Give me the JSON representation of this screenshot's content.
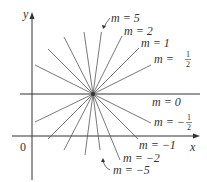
{
  "diagram": {
    "axes": {
      "x_label": "x",
      "y_label": "y",
      "origin_label": "0"
    },
    "center": {
      "x": 93,
      "y": 94
    },
    "lines": [
      {
        "m": "5",
        "label": "m = 5",
        "slope": 5
      },
      {
        "m": "2",
        "label": "m = 2",
        "slope": 2
      },
      {
        "m": "1",
        "label": "m = 1",
        "slope": 1
      },
      {
        "m": "1/2",
        "label": "m = 1/2",
        "slope": 0.5
      },
      {
        "m": "0",
        "label": "m = 0",
        "slope": 0
      },
      {
        "m": "-1/2",
        "label": "m = -1/2",
        "slope": -0.5
      },
      {
        "m": "-1",
        "label": "m = -1",
        "slope": -1
      },
      {
        "m": "-2",
        "label": "m = -2",
        "slope": -2
      },
      {
        "m": "-5",
        "label": "m = -5",
        "slope": -5
      }
    ],
    "labels": {
      "m5": "m = 5",
      "m2": "m = 2",
      "m1": "m = 1",
      "mhalf_prefix": "m = ",
      "mhalf_num": "1",
      "mhalf_den": "2",
      "m0": "m = 0",
      "mneghalf_prefix": "m = −",
      "mneghalf_num": "1",
      "mneghalf_den": "2",
      "mneg1": "m = −1",
      "mneg2": "m = −2",
      "mneg5": "m = −5"
    },
    "colors": {
      "line": "#555555",
      "axis": "#333333",
      "text": "#333333"
    }
  }
}
